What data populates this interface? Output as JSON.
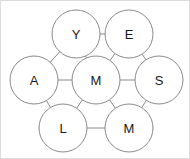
{
  "diagram": {
    "background_color": "#ffffff",
    "border_color": "#dcdcdc",
    "node_fill": "#ffffff",
    "node_stroke": "#8a8a8a",
    "edge_color": "#8a8a8a",
    "label_color": "#1a1a1a",
    "node_radius": 24,
    "nodes": [
      {
        "id": "y",
        "label": "Y",
        "cx": 75,
        "cy": 33
      },
      {
        "id": "e",
        "label": "E",
        "cx": 128,
        "cy": 33
      },
      {
        "id": "a",
        "label": "A",
        "cx": 33,
        "cy": 79
      },
      {
        "id": "m1",
        "label": "M",
        "cx": 95,
        "cy": 79
      },
      {
        "id": "s",
        "label": "S",
        "cx": 158,
        "cy": 79
      },
      {
        "id": "l",
        "label": "L",
        "cx": 62,
        "cy": 127
      },
      {
        "id": "m2",
        "label": "M",
        "cx": 128,
        "cy": 127
      }
    ],
    "edges": [
      {
        "id": "y-e",
        "from": "y",
        "to": "e"
      },
      {
        "id": "y-a",
        "from": "y",
        "to": "a"
      },
      {
        "id": "y-m1",
        "from": "y",
        "to": "m1"
      },
      {
        "id": "e-m1",
        "from": "e",
        "to": "m1"
      },
      {
        "id": "e-s",
        "from": "e",
        "to": "s"
      },
      {
        "id": "a-m1",
        "from": "a",
        "to": "m1"
      },
      {
        "id": "m1-s",
        "from": "m1",
        "to": "s"
      },
      {
        "id": "a-l",
        "from": "a",
        "to": "l"
      },
      {
        "id": "m1-l",
        "from": "m1",
        "to": "l"
      },
      {
        "id": "m1-m2",
        "from": "m1",
        "to": "m2"
      },
      {
        "id": "s-m2",
        "from": "s",
        "to": "m2"
      },
      {
        "id": "l-m2",
        "from": "l",
        "to": "m2"
      }
    ]
  }
}
